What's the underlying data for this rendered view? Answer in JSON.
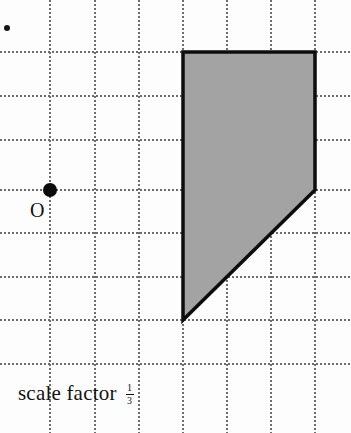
{
  "page": {
    "width": 351,
    "height": 433,
    "background_color": "#fdfdfd"
  },
  "grid": {
    "spacing_px": 44,
    "line_color": "#6d6d6d",
    "style": "dotted",
    "vertical_lines_x": [
      50,
      95,
      139,
      183,
      227,
      271,
      315
    ],
    "horizontal_lines_y": [
      52,
      96,
      140,
      190,
      233,
      277,
      320,
      364
    ]
  },
  "center_of_enlargement": {
    "label": "O",
    "dot_x": 50,
    "dot_y": 190,
    "dot_radius": 7,
    "dot_color": "#0a0a0a",
    "label_x": 30,
    "label_y": 200,
    "label_font_size": 20
  },
  "shape": {
    "name": "shaded-polygon",
    "fill_color": "#a3a3a3",
    "stroke_color": "#0d0d0d",
    "stroke_width": 3.5,
    "points": [
      {
        "x": 183,
        "y": 52
      },
      {
        "x": 315,
        "y": 52
      },
      {
        "x": 315,
        "y": 190
      },
      {
        "x": 183,
        "y": 320
      }
    ],
    "points_attr": "183,52 315,52 315,190 183,320"
  },
  "caption": {
    "text": "scale factor",
    "x": 18,
    "y": 381,
    "fraction": {
      "numerator": "1",
      "denominator": "3"
    }
  },
  "artifacts": {
    "speck": {
      "x": 4,
      "y": 25,
      "size": 6
    }
  }
}
